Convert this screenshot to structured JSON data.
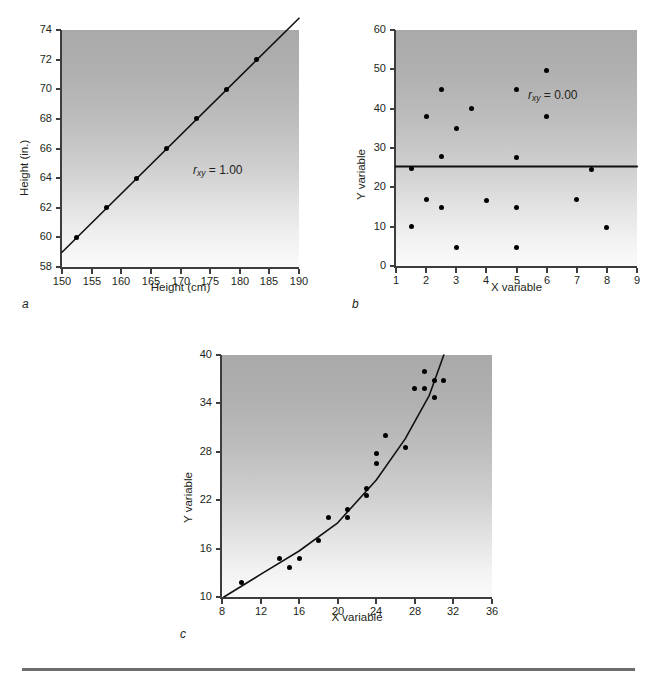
{
  "figure": {
    "panels": [
      "a",
      "b",
      "c"
    ],
    "bottom_rule": true
  },
  "chart_data": [
    {
      "id": "a",
      "type": "scatter",
      "panel_label": "a",
      "title": "",
      "xlabel": "Height (cm)",
      "ylabel": "Height (in.)",
      "xlim": [
        150,
        190
      ],
      "ylim": [
        58,
        74
      ],
      "xticks": [
        150,
        155,
        160,
        165,
        170,
        175,
        180,
        185,
        190
      ],
      "yticks": [
        58,
        60,
        62,
        64,
        66,
        68,
        70,
        72,
        74
      ],
      "grid": false,
      "legend": "none",
      "annotation": "r_xy = 1.00",
      "annotation_symbol": "r",
      "annotation_sub": "xy",
      "annotation_value": "= 1.00",
      "fit_line": {
        "type": "linear",
        "x": [
          150,
          190
        ],
        "y": [
          59.0,
          74.8
        ]
      },
      "points": [
        {
          "x": 152.4,
          "y": 60.0
        },
        {
          "x": 157.5,
          "y": 62.0
        },
        {
          "x": 162.6,
          "y": 64.0
        },
        {
          "x": 167.6,
          "y": 66.0
        },
        {
          "x": 172.7,
          "y": 68.0
        },
        {
          "x": 177.8,
          "y": 70.0
        },
        {
          "x": 182.9,
          "y": 72.0
        }
      ]
    },
    {
      "id": "b",
      "type": "scatter",
      "panel_label": "b",
      "title": "",
      "xlabel": "X variable",
      "ylabel": "Y variable",
      "xlim": [
        1,
        9
      ],
      "ylim": [
        0,
        60
      ],
      "xticks": [
        1,
        2,
        3,
        4,
        5,
        6,
        7,
        8,
        9
      ],
      "yticks": [
        0,
        10,
        20,
        30,
        40,
        50,
        60
      ],
      "grid": false,
      "legend": "none",
      "annotation": "r_xy = 0.00",
      "annotation_symbol": "r",
      "annotation_sub": "xy",
      "annotation_value": "= 0.00",
      "fit_line": {
        "type": "horizontal",
        "x": [
          1,
          9
        ],
        "y": [
          25.3,
          25.3
        ]
      },
      "points": [
        {
          "x": 1.5,
          "y": 24.8
        },
        {
          "x": 1.5,
          "y": 10.0
        },
        {
          "x": 2.0,
          "y": 38.0
        },
        {
          "x": 2.0,
          "y": 17.0
        },
        {
          "x": 2.5,
          "y": 44.8
        },
        {
          "x": 2.5,
          "y": 27.8
        },
        {
          "x": 2.5,
          "y": 15.0
        },
        {
          "x": 3.0,
          "y": 35.0
        },
        {
          "x": 3.0,
          "y": 4.6
        },
        {
          "x": 3.5,
          "y": 40.0
        },
        {
          "x": 4.0,
          "y": 16.7
        },
        {
          "x": 5.0,
          "y": 44.8
        },
        {
          "x": 5.0,
          "y": 27.6
        },
        {
          "x": 5.0,
          "y": 15.0
        },
        {
          "x": 5.0,
          "y": 4.6
        },
        {
          "x": 6.0,
          "y": 49.8
        },
        {
          "x": 6.0,
          "y": 37.9
        },
        {
          "x": 7.0,
          "y": 16.8
        },
        {
          "x": 7.5,
          "y": 24.6
        },
        {
          "x": 8.0,
          "y": 9.8
        }
      ]
    },
    {
      "id": "c",
      "type": "scatter",
      "panel_label": "c",
      "title": "",
      "xlabel": "X variable",
      "ylabel": "Y variable",
      "xlim": [
        8,
        36
      ],
      "ylim": [
        10,
        40
      ],
      "xticks": [
        8,
        12,
        16,
        20,
        24,
        28,
        32,
        36
      ],
      "yticks": [
        10,
        16,
        22,
        28,
        34,
        40
      ],
      "grid": false,
      "legend": "none",
      "annotation": "",
      "fit_line": {
        "type": "curve",
        "points": [
          {
            "x": 8.2,
            "y": 10.0
          },
          {
            "x": 12.0,
            "y": 12.8
          },
          {
            "x": 16.0,
            "y": 15.7
          },
          {
            "x": 20.0,
            "y": 19.2
          },
          {
            "x": 24.0,
            "y": 24.5
          },
          {
            "x": 27.0,
            "y": 29.6
          },
          {
            "x": 29.5,
            "y": 35.0
          },
          {
            "x": 31.0,
            "y": 40.0
          }
        ]
      },
      "points": [
        {
          "x": 10.0,
          "y": 11.8
        },
        {
          "x": 14.0,
          "y": 14.8
        },
        {
          "x": 15.0,
          "y": 13.7
        },
        {
          "x": 16.0,
          "y": 14.8
        },
        {
          "x": 18.0,
          "y": 17.0
        },
        {
          "x": 19.0,
          "y": 19.9
        },
        {
          "x": 21.0,
          "y": 20.8
        },
        {
          "x": 21.0,
          "y": 19.8
        },
        {
          "x": 23.0,
          "y": 23.5
        },
        {
          "x": 23.0,
          "y": 22.6
        },
        {
          "x": 24.0,
          "y": 27.8
        },
        {
          "x": 24.0,
          "y": 26.5
        },
        {
          "x": 25.0,
          "y": 30.0
        },
        {
          "x": 27.0,
          "y": 28.5
        },
        {
          "x": 28.0,
          "y": 35.9
        },
        {
          "x": 29.0,
          "y": 37.9
        },
        {
          "x": 29.0,
          "y": 35.9
        },
        {
          "x": 30.0,
          "y": 34.7
        },
        {
          "x": 30.0,
          "y": 36.8
        },
        {
          "x": 31.0,
          "y": 36.8
        }
      ]
    }
  ]
}
